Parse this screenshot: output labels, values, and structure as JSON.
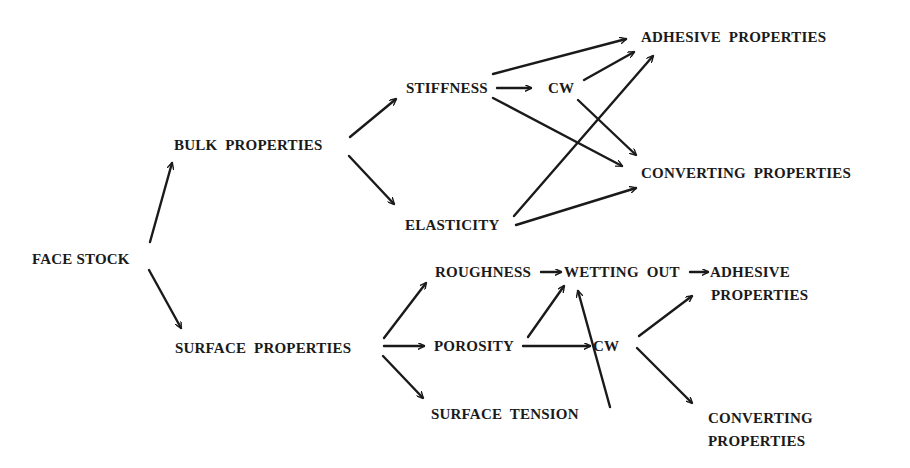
{
  "diagram": {
    "type": "flow",
    "nodes": {
      "face_stock": {
        "label": "FACE STOCK",
        "x": 32,
        "y": 250
      },
      "bulk_properties": {
        "label": "BULK  PROPERTIES",
        "x": 174,
        "y": 136
      },
      "surface_properties": {
        "label": "SURFACE  PROPERTIES",
        "x": 175,
        "y": 339
      },
      "stiffness": {
        "label": "STIFFNESS",
        "x": 406,
        "y": 79
      },
      "cw_top": {
        "label": "CW",
        "x": 548,
        "y": 79
      },
      "elasticity": {
        "label": "ELASTICITY",
        "x": 405,
        "y": 216
      },
      "adhesive_properties_top": {
        "label": "ADHESIVE  PROPERTIES",
        "x": 641,
        "y": 28
      },
      "converting_properties_top": {
        "label": "CONVERTING  PROPERTIES",
        "x": 641,
        "y": 164
      },
      "roughness": {
        "label": "ROUGHNESS",
        "x": 435,
        "y": 263
      },
      "wetting_out": {
        "label": "WETTING  OUT",
        "x": 564,
        "y": 263
      },
      "adhesive_bottom_line1": {
        "label": "ADHESIVE",
        "x": 710,
        "y": 263
      },
      "adhesive_bottom_line2": {
        "label": "PROPERTIES",
        "x": 711,
        "y": 286
      },
      "porosity": {
        "label": "POROSITY",
        "x": 434,
        "y": 337
      },
      "cw_bottom": {
        "label": "CW",
        "x": 593,
        "y": 337
      },
      "surface_tension": {
        "label": "SURFACE  TENSION",
        "x": 431,
        "y": 405
      },
      "converting_bottom_line1": {
        "label": "CONVERTING",
        "x": 708,
        "y": 409
      },
      "converting_bottom_line2": {
        "label": "PROPERTIES",
        "x": 708,
        "y": 432
      }
    },
    "edges": [
      {
        "from": "face_stock",
        "to": "bulk_properties",
        "x1": 150,
        "y1": 242,
        "x2": 172,
        "y2": 163
      },
      {
        "from": "face_stock",
        "to": "surface_properties",
        "x1": 149,
        "y1": 270,
        "x2": 181,
        "y2": 328
      },
      {
        "from": "bulk_properties",
        "to": "stiffness",
        "x1": 350,
        "y1": 137,
        "x2": 396,
        "y2": 99
      },
      {
        "from": "bulk_properties",
        "to": "elasticity",
        "x1": 349,
        "y1": 156,
        "x2": 394,
        "y2": 204
      },
      {
        "from": "stiffness",
        "to": "cw_top",
        "x1": 497,
        "y1": 88,
        "x2": 531,
        "y2": 88
      },
      {
        "from": "stiffness",
        "to": "adhesive_properties_top",
        "x1": 493,
        "y1": 74,
        "x2": 626,
        "y2": 39
      },
      {
        "from": "stiffness",
        "to": "converting_properties_top",
        "x1": 493,
        "y1": 98,
        "x2": 622,
        "y2": 166
      },
      {
        "from": "cw_top",
        "to": "adhesive_properties_top",
        "x1": 584,
        "y1": 80,
        "x2": 634,
        "y2": 52
      },
      {
        "from": "cw_top",
        "to": "converting_properties_top",
        "x1": 578,
        "y1": 100,
        "x2": 636,
        "y2": 155
      },
      {
        "from": "elasticity",
        "to": "adhesive_properties_top",
        "x1": 514,
        "y1": 216,
        "x2": 653,
        "y2": 56
      },
      {
        "from": "elasticity",
        "to": "converting_properties_top",
        "x1": 516,
        "y1": 225,
        "x2": 636,
        "y2": 188
      },
      {
        "from": "surface_properties",
        "to": "roughness",
        "x1": 384,
        "y1": 338,
        "x2": 426,
        "y2": 283
      },
      {
        "from": "surface_properties",
        "to": "porosity",
        "x1": 384,
        "y1": 346,
        "x2": 424,
        "y2": 346
      },
      {
        "from": "surface_properties",
        "to": "surface_tension",
        "x1": 383,
        "y1": 356,
        "x2": 423,
        "y2": 398
      },
      {
        "from": "roughness",
        "to": "wetting_out",
        "x1": 541,
        "y1": 272,
        "x2": 561,
        "y2": 272
      },
      {
        "from": "wetting_out",
        "to": "adhesive_bottom_line1",
        "x1": 690,
        "y1": 272,
        "x2": 708,
        "y2": 272
      },
      {
        "from": "porosity",
        "to": "wetting_out",
        "x1": 528,
        "y1": 337,
        "x2": 564,
        "y2": 286
      },
      {
        "from": "porosity",
        "to": "cw_bottom",
        "x1": 523,
        "y1": 346,
        "x2": 590,
        "y2": 346
      },
      {
        "from": "surface_tension",
        "to": "wetting_out",
        "x1": 610,
        "y1": 407,
        "x2": 578,
        "y2": 291
      },
      {
        "from": "cw_bottom",
        "to": "adhesive_bottom_line1",
        "x1": 639,
        "y1": 336,
        "x2": 692,
        "y2": 296
      },
      {
        "from": "cw_bottom",
        "to": "converting_bottom_line1",
        "x1": 637,
        "y1": 348,
        "x2": 692,
        "y2": 403
      }
    ]
  }
}
